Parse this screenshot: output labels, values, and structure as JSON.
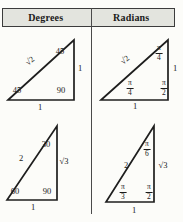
{
  "header": {
    "left": "Degrees",
    "right": "Radians"
  },
  "triangles": {
    "deg45": {
      "hypotenuse": "√2",
      "top_angle": "45",
      "left_angle": "45",
      "right_angle": "90",
      "vertical_side": "1",
      "bottom_side": "1"
    },
    "rad45": {
      "hypotenuse": "√2",
      "top_angle_num": "π",
      "top_angle_den": "4",
      "left_angle_num": "π",
      "left_angle_den": "4",
      "right_angle_num": "π",
      "right_angle_den": "2",
      "vertical_side": "1",
      "bottom_side": "1"
    },
    "deg30": {
      "hypotenuse": "2",
      "top_angle": "30",
      "left_angle": "60",
      "right_angle": "90",
      "vertical_side": "√3",
      "bottom_side": "1"
    },
    "rad30": {
      "hypotenuse": "2",
      "top_angle_num": "π",
      "top_angle_den": "6",
      "left_angle_num": "π",
      "left_angle_den": "3",
      "right_angle_num": "π",
      "right_angle_den": "2",
      "vertical_side": "√3",
      "bottom_side": "1"
    }
  },
  "colors": {
    "header_bg": "#e3e4de",
    "border": "#3c3c3c",
    "line": "#1e1e1e",
    "text": "#1a1a1a",
    "page_bg": "#fcfcf9"
  }
}
